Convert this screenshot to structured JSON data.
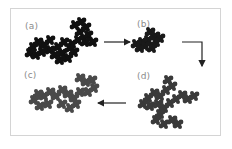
{
  "figure": {
    "panels": [
      {
        "id": "a",
        "label": "(a)",
        "color": "#111111"
      },
      {
        "id": "b",
        "label": "(b)",
        "color": "#1a1a1a"
      },
      {
        "id": "c",
        "label": "(c)",
        "color": "#4a4a4a"
      },
      {
        "id": "d",
        "label": "(d)",
        "color": "#3a3a3a"
      }
    ],
    "arrows": [
      {
        "from": "a",
        "to": "b"
      },
      {
        "from": "b",
        "to": "d"
      },
      {
        "from": "d",
        "to": "c"
      }
    ],
    "frame_color": "#d4d4d4",
    "arrow_color": "#222222"
  }
}
